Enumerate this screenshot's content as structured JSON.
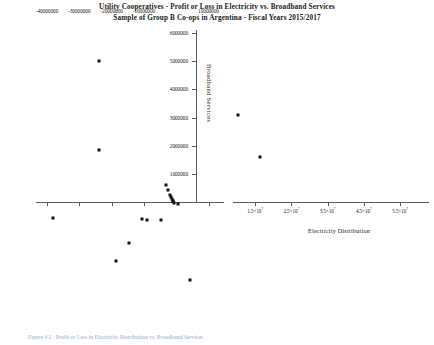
{
  "figure": {
    "title_line_1": "Utility Cooperatives  - Profit or Loss in Electricity vs. Broadband Services",
    "title_line_2": "Sample of Group B Co-ops in Argentina - Fiscal Years 2015/2017",
    "caption": "Figure 4.2 - Profit or Loss in Electricity Distribution vs. Broadband Services"
  },
  "chart_data": {
    "type": "scatter",
    "title": "Utility Cooperatives  - Profit or Loss in Electricity vs. Broadband Services",
    "subtitle": "Sample of Group B Co-ops in Argentina - Fiscal Years 2015/2017",
    "xlabel": "Electricity Distribution",
    "ylabel": "Broadband Services",
    "grid": false,
    "legend": "none",
    "xlim": [
      -45000000,
      57000000
    ],
    "ylim": [
      -3100000,
      6400000
    ],
    "x_ticks_primary": [
      "-40000000",
      "-30000000",
      "-20000000",
      "-10000000",
      "10000000"
    ],
    "x_tick_values_primary": [
      -40000000,
      -30000000,
      -20000000,
      -10000000,
      10000000
    ],
    "x_ticks_secondary": [
      "1.5×10⁷",
      "2.5×10⁷",
      "3.5×10⁷",
      "4.5×10⁷",
      "5.5×10⁷"
    ],
    "x_tick_values_secondary": [
      15000000,
      25000000,
      35000000,
      45000000,
      55000000
    ],
    "y_ticks": [
      "1000000",
      "2000000",
      "3000000",
      "4000000",
      "5000000",
      "6000000"
    ],
    "y_tick_values": [
      1000000,
      2000000,
      3000000,
      4000000,
      5000000,
      6000000
    ],
    "points": [
      {
        "x": -24000000,
        "y": 5000000
      },
      {
        "x": -24000000,
        "y": 1850000
      },
      {
        "x": -3200000,
        "y": 600000
      },
      {
        "x": -2400000,
        "y": 430000
      },
      {
        "x": -1900000,
        "y": 250000
      },
      {
        "x": -1500000,
        "y": 180000
      },
      {
        "x": -1300000,
        "y": 120000
      },
      {
        "x": -1100000,
        "y": 60000
      },
      {
        "x": -900000,
        "y": 30000
      },
      {
        "x": -700000,
        "y": -40000
      },
      {
        "x": 600000,
        "y": -60000
      },
      {
        "x": -38000000,
        "y": -550000
      },
      {
        "x": -10500000,
        "y": -600000
      },
      {
        "x": -8900000,
        "y": -620000
      },
      {
        "x": -4600000,
        "y": -640000
      },
      {
        "x": -14500000,
        "y": -1450000
      },
      {
        "x": -18500000,
        "y": -2100000
      },
      {
        "x": 4300000,
        "y": -2750000
      },
      {
        "x": 19000000,
        "y": 3100000
      },
      {
        "x": 26000000,
        "y": 1620000
      }
    ]
  }
}
